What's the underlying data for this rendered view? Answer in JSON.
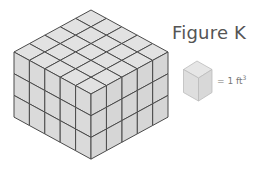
{
  "figure": {
    "title": "Figure K",
    "prism": {
      "length_units": 5,
      "width_units": 5,
      "height_units": 3,
      "origin_top": [
        91,
        10
      ],
      "u_vector": [
        15.4,
        8.4
      ],
      "v_vector": [
        -15.4,
        8.4
      ],
      "h_unit": 21.7
    },
    "legend": {
      "equals": "= 1 ft",
      "exponent": "3",
      "cube": {
        "top": [
          197,
          61
        ],
        "u": [
          15,
          8.5
        ],
        "v": [
          -13.5,
          8.5
        ],
        "h": 23
      }
    },
    "colors": {
      "face_top": "#e2e2e2",
      "face_left": "#dadada",
      "face_right": "#d6d6d6",
      "line": "#4a4a4a",
      "legend_face": "#dedede",
      "legend_line": "#bbbbbb"
    }
  }
}
